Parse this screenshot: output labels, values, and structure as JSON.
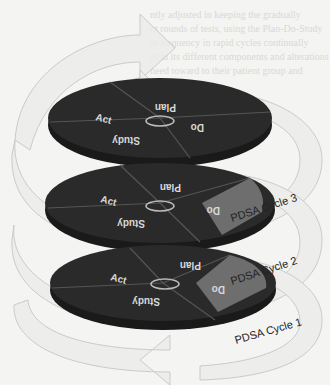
{
  "diagram": {
    "segments": [
      "Act",
      "Plan",
      "Do",
      "Study"
    ],
    "cycles": [
      {
        "label": "PDSA Cycle 3",
        "level": "top",
        "highlight": "Do"
      },
      {
        "label": "PDSA Cycle 2",
        "level": "middle",
        "highlight": "Do"
      },
      {
        "label": "PDSA Cycle 1",
        "level": "bottom",
        "highlight": "Do"
      }
    ],
    "top_disc": {
      "act": "Act",
      "plan": "Plan",
      "do": "Do",
      "study": "Study"
    },
    "mid_disc": {
      "act": "Act",
      "plan": "Plan",
      "do": "Do",
      "study": "Study"
    },
    "bot_disc": {
      "act": "Act",
      "plan": "Plan",
      "do": "Do",
      "study": "Study"
    },
    "labels": {
      "cycle3": "PDSA Cycle 3",
      "cycle2": "PDSA Cycle 2",
      "cycle1": "PDSA Cycle 1"
    },
    "colors": {
      "disc": "#2a2a2a",
      "disc_side": "#1a1a1a",
      "highlight": "#6e6e6e",
      "arrow_fill": "#ececea",
      "arrow_stroke": "#c4c4c2"
    }
  },
  "background_text": [
    "ntly adjusted in keeping the gradually",
    "nt rounds of tests, using the Plan-Do-Study",
    "nt frequency in rapid cycles continually",
    "nt in its different components and alterations",
    "need toward to their patient group and"
  ]
}
